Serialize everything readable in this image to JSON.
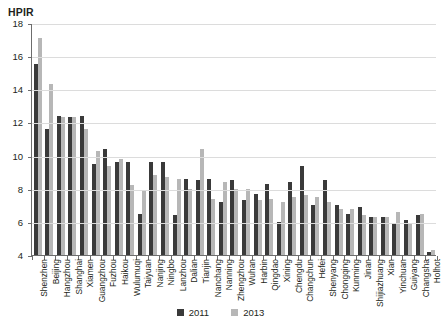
{
  "chart_data": {
    "type": "bar",
    "title": "HPIR",
    "xlabel": "",
    "ylabel": "HPIR",
    "ylim": [
      4,
      18
    ],
    "ytick_step": 2,
    "yticks": [
      18,
      16,
      14,
      12,
      10,
      8,
      6,
      4
    ],
    "grid": true,
    "legend_position": "bottom-center",
    "categories": [
      "Shenzhen",
      "Beijing",
      "Hangzhou",
      "Shanghai",
      "Xiamen",
      "Guangzhou",
      "Fuzhou",
      "Haikou",
      "Wulumuqi",
      "Taiyuan",
      "Nanjing",
      "Ningbo",
      "Lanzhou",
      "Dalian",
      "Tianjin",
      "Nanchang",
      "Nanning",
      "Zhengzhou",
      "Wuhan",
      "Harbin",
      "Qingdao",
      "Xining",
      "Chengdu",
      "Changchun",
      "Hefei",
      "Shenyang",
      "Chongqing",
      "Kunming",
      "Jinan",
      "Shijiazhuang",
      "Xian",
      "Yinchuan",
      "Guiyang",
      "Changsha",
      "Holhot"
    ],
    "series": [
      {
        "name": "2011",
        "color": "#3a3a3a",
        "values": [
          15.5,
          11.6,
          12.4,
          12.3,
          12.4,
          9.5,
          10.4,
          9.6,
          9.6,
          6.5,
          9.6,
          9.6,
          6.4,
          8.6,
          8.5,
          8.6,
          7.2,
          8.5,
          7.3,
          7.7,
          8.3,
          6.0,
          8.4,
          9.4,
          7.0,
          8.5,
          7.0,
          6.5,
          6.9,
          6.3,
          6.3,
          5.9,
          6.1,
          6.4,
          4.2
        ]
      },
      {
        "name": "2013",
        "color": "#b7b7b7",
        "values": [
          17.1,
          14.3,
          12.3,
          12.3,
          11.6,
          10.3,
          9.4,
          9.8,
          8.2,
          7.9,
          8.8,
          8.7,
          8.6,
          8.0,
          10.4,
          7.4,
          8.4,
          8.0,
          8.0,
          7.3,
          7.4,
          7.2,
          7.5,
          7.6,
          7.5,
          7.2,
          6.8,
          6.8,
          6.4,
          6.3,
          6.3,
          6.6,
          5.9,
          6.5,
          4.3
        ]
      }
    ]
  },
  "legend": {
    "items": [
      {
        "label": "2011"
      },
      {
        "label": "2013"
      }
    ]
  }
}
